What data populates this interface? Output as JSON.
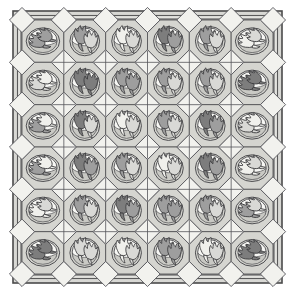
{
  "artwork": {
    "title": "Tulip Medallion Lattice Quilt Pattern",
    "kind": "grayscale line drawing",
    "canvas": {
      "width": 295,
      "height": 295,
      "background": "#ffffff"
    },
    "frame": {
      "outer_border_color": "#4a4a4a",
      "outer_border_fill": "#d8d8d4",
      "inner_band_fill": "#e3e3df",
      "inner_band_line": "#5a5a5a",
      "outer_rect": {
        "x": 13,
        "y": 11,
        "width": 269,
        "height": 272
      },
      "inner_rect": {
        "x": 20,
        "y": 18,
        "width": 255,
        "height": 258
      }
    },
    "grid": {
      "rows": 6,
      "cols": 6,
      "field_rect": {
        "x": 22,
        "y": 20,
        "width": 251,
        "height": 254
      },
      "cell_width": 41.8,
      "cell_height": 42.3,
      "lattice_line_color": "#58585a",
      "lattice_fill": "#d5d5d0",
      "block_fill": "#e8e8e4",
      "diamond_fill": "#f2f2ee",
      "diamond_line": "#55555a",
      "cross_line": "#55555a"
    },
    "motif": {
      "medallion_outer_fill": "#d2d2cd",
      "medallion_outer_line": "#4f4f52",
      "medallion_inner_fill": "#f7f7f4",
      "medallion_inner_line": "#4f4f52",
      "shade_fill": "#c9c9c4",
      "tulip_outline": "#3b3b3d",
      "tones": {
        "dark": "#7d7d7d",
        "medium": "#9e9e9e",
        "light": "#d9d9d6",
        "pale": "#f0f0ec"
      },
      "orientations": {
        "upright": "upright-tulip-pair",
        "rotated": "sideways-tulip-pair"
      }
    },
    "cells": [
      [
        {
          "orient": "rotated",
          "tone_a": "medium",
          "tone_b": "medium"
        },
        {
          "orient": "upright",
          "tone_a": "medium",
          "tone_b": "light"
        },
        {
          "orient": "upright",
          "tone_a": "pale",
          "tone_b": "light"
        },
        {
          "orient": "upright",
          "tone_a": "dark",
          "tone_b": "medium"
        },
        {
          "orient": "upright",
          "tone_a": "medium",
          "tone_b": "light"
        },
        {
          "orient": "rotated",
          "tone_a": "pale",
          "tone_b": "light"
        }
      ],
      [
        {
          "orient": "rotated",
          "tone_a": "light",
          "tone_b": "pale"
        },
        {
          "orient": "upright",
          "tone_a": "dark",
          "tone_b": "dark"
        },
        {
          "orient": "upright",
          "tone_a": "medium",
          "tone_b": "medium"
        },
        {
          "orient": "upright",
          "tone_a": "medium",
          "tone_b": "light"
        },
        {
          "orient": "upright",
          "tone_a": "medium",
          "tone_b": "light"
        },
        {
          "orient": "rotated",
          "tone_a": "dark",
          "tone_b": "dark"
        }
      ],
      [
        {
          "orient": "rotated",
          "tone_a": "medium",
          "tone_b": "pale"
        },
        {
          "orient": "upright",
          "tone_a": "dark",
          "tone_b": "light"
        },
        {
          "orient": "upright",
          "tone_a": "pale",
          "tone_b": "light"
        },
        {
          "orient": "upright",
          "tone_a": "medium",
          "tone_b": "light"
        },
        {
          "orient": "upright",
          "tone_a": "dark",
          "tone_b": "medium"
        },
        {
          "orient": "rotated",
          "tone_a": "light",
          "tone_b": "pale"
        }
      ],
      [
        {
          "orient": "rotated",
          "tone_a": "medium",
          "tone_b": "pale"
        },
        {
          "orient": "upright",
          "tone_a": "dark",
          "tone_b": "medium"
        },
        {
          "orient": "upright",
          "tone_a": "medium",
          "tone_b": "light"
        },
        {
          "orient": "upright",
          "tone_a": "pale",
          "tone_b": "light"
        },
        {
          "orient": "upright",
          "tone_a": "dark",
          "tone_b": "medium"
        },
        {
          "orient": "rotated",
          "tone_a": "pale",
          "tone_b": "light"
        }
      ],
      [
        {
          "orient": "rotated",
          "tone_a": "pale",
          "tone_b": "light"
        },
        {
          "orient": "upright",
          "tone_a": "medium",
          "tone_b": "light"
        },
        {
          "orient": "upright",
          "tone_a": "dark",
          "tone_b": "medium"
        },
        {
          "orient": "upright",
          "tone_a": "medium",
          "tone_b": "medium"
        },
        {
          "orient": "upright",
          "tone_a": "medium",
          "tone_b": "light"
        },
        {
          "orient": "rotated",
          "tone_a": "medium",
          "tone_b": "light"
        }
      ],
      [
        {
          "orient": "rotated",
          "tone_a": "dark",
          "tone_b": "dark"
        },
        {
          "orient": "upright",
          "tone_a": "light",
          "tone_b": "light"
        },
        {
          "orient": "upright",
          "tone_a": "pale",
          "tone_b": "light"
        },
        {
          "orient": "upright",
          "tone_a": "medium",
          "tone_b": "medium"
        },
        {
          "orient": "upright",
          "tone_a": "pale",
          "tone_b": "light"
        },
        {
          "orient": "rotated",
          "tone_a": "dark",
          "tone_b": "dark"
        }
      ]
    ]
  }
}
